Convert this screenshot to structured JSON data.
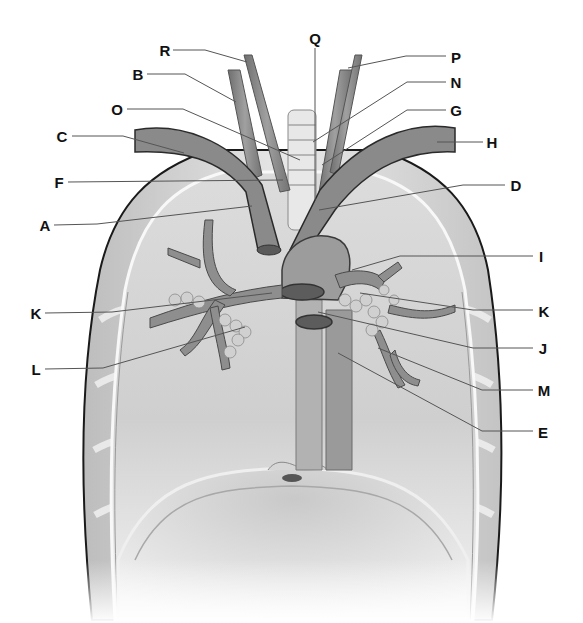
{
  "diagram": {
    "colors": {
      "background": "#ffffff",
      "outline": "#1a1a1a",
      "tissue_light": "#e6e6e6",
      "tissue_mid": "#c8c8c8",
      "vessel": "#8c8c8c",
      "vessel_dark": "#6e6e6e",
      "leader_line": "#555555",
      "label_text": "#111111"
    },
    "labels": [
      {
        "id": "R",
        "text": "R",
        "x": 165,
        "y": 50,
        "line": [
          [
            173,
            50
          ],
          [
            205,
            50
          ],
          [
            247,
            62
          ]
        ]
      },
      {
        "id": "B",
        "text": "B",
        "x": 138,
        "y": 74,
        "line": [
          [
            147,
            74
          ],
          [
            185,
            74
          ],
          [
            236,
            102
          ]
        ]
      },
      {
        "id": "O",
        "text": "O",
        "x": 117,
        "y": 109,
        "line": [
          [
            127,
            109
          ],
          [
            183,
            109
          ],
          [
            300,
            160
          ]
        ]
      },
      {
        "id": "C",
        "text": "C",
        "x": 62,
        "y": 136,
        "line": [
          [
            72,
            136
          ],
          [
            123,
            136
          ],
          [
            184,
            153
          ]
        ]
      },
      {
        "id": "F",
        "text": "F",
        "x": 59,
        "y": 182,
        "line": [
          [
            68,
            182
          ],
          [
            283,
            180
          ]
        ]
      },
      {
        "id": "A",
        "text": "A",
        "x": 45,
        "y": 225,
        "line": [
          [
            54,
            225
          ],
          [
            97,
            224
          ],
          [
            252,
            206
          ]
        ]
      },
      {
        "id": "Q",
        "text": "Q",
        "x": 315,
        "y": 38,
        "line": [
          [
            315,
            48
          ],
          [
            315,
            200
          ]
        ]
      },
      {
        "id": "P",
        "text": "P",
        "x": 456,
        "y": 57,
        "line": [
          [
            446,
            56
          ],
          [
            406,
            56
          ],
          [
            348,
            68
          ]
        ]
      },
      {
        "id": "N",
        "text": "N",
        "x": 456,
        "y": 82,
        "line": [
          [
            446,
            82
          ],
          [
            407,
            82
          ],
          [
            313,
            142
          ]
        ]
      },
      {
        "id": "G",
        "text": "G",
        "x": 456,
        "y": 110,
        "line": [
          [
            446,
            110
          ],
          [
            407,
            110
          ],
          [
            322,
            165
          ]
        ]
      },
      {
        "id": "H",
        "text": "H",
        "x": 492,
        "y": 142,
        "line": [
          [
            483,
            142
          ],
          [
            437,
            142
          ]
        ]
      },
      {
        "id": "D",
        "text": "D",
        "x": 516,
        "y": 185,
        "line": [
          [
            505,
            185
          ],
          [
            463,
            185
          ],
          [
            319,
            210
          ]
        ]
      },
      {
        "id": "I",
        "text": "I",
        "x": 541,
        "y": 256,
        "line": [
          [
            533,
            256
          ],
          [
            400,
            256
          ],
          [
            352,
            270
          ]
        ]
      },
      {
        "id": "K_right",
        "text": "K",
        "x": 544,
        "y": 311,
        "line": [
          [
            533,
            310
          ],
          [
            473,
            310
          ],
          [
            360,
            293
          ]
        ]
      },
      {
        "id": "J",
        "text": "J",
        "x": 543,
        "y": 348,
        "line": [
          [
            533,
            348
          ],
          [
            473,
            348
          ],
          [
            318,
            312
          ]
        ]
      },
      {
        "id": "M",
        "text": "M",
        "x": 544,
        "y": 390,
        "line": [
          [
            533,
            390
          ],
          [
            482,
            390
          ],
          [
            378,
            348
          ]
        ]
      },
      {
        "id": "E",
        "text": "E",
        "x": 543,
        "y": 432,
        "line": [
          [
            533,
            431
          ],
          [
            482,
            431
          ],
          [
            338,
            353
          ]
        ]
      },
      {
        "id": "K_left",
        "text": "K",
        "x": 36,
        "y": 313,
        "line": [
          [
            45,
            313
          ],
          [
            112,
            312
          ],
          [
            272,
            293
          ]
        ]
      },
      {
        "id": "L",
        "text": "L",
        "x": 36,
        "y": 369,
        "line": [
          [
            45,
            369
          ],
          [
            103,
            368
          ],
          [
            245,
            327
          ]
        ]
      }
    ]
  }
}
